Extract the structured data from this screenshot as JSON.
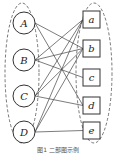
{
  "diagram": {
    "type": "bipartite-graph",
    "colors": {
      "stroke": "#333333",
      "edge": "#444444",
      "dashed": "#555555",
      "fill": "#ffffff"
    },
    "left_set": {
      "shape": "circle",
      "ellipse": {
        "cx": 22,
        "cy": 73,
        "rx": 17,
        "ry": 70
      },
      "nodes": [
        {
          "id": "A",
          "label": "A",
          "x": 24,
          "y": 23
        },
        {
          "id": "B",
          "label": "B",
          "x": 24,
          "y": 60
        },
        {
          "id": "C",
          "label": "C",
          "x": 24,
          "y": 96
        },
        {
          "id": "D",
          "label": "D",
          "x": 24,
          "y": 132
        }
      ],
      "radius": 11
    },
    "right_set": {
      "shape": "square",
      "ellipse": {
        "cx": 94,
        "cy": 73,
        "rx": 18,
        "ry": 70
      },
      "nodes": [
        {
          "id": "a",
          "label": "a",
          "x": 83,
          "y": 11
        },
        {
          "id": "b",
          "label": "b",
          "x": 83,
          "y": 40
        },
        {
          "id": "c",
          "label": "c",
          "x": 83,
          "y": 69
        },
        {
          "id": "d",
          "label": "d",
          "x": 83,
          "y": 97
        },
        {
          "id": "e",
          "label": "e",
          "x": 83,
          "y": 122
        }
      ],
      "size": 17
    },
    "edges": [
      [
        "A",
        "b"
      ],
      [
        "A",
        "d"
      ],
      [
        "B",
        "a"
      ],
      [
        "B",
        "b"
      ],
      [
        "B",
        "c"
      ],
      [
        "C",
        "a"
      ],
      [
        "C",
        "b"
      ],
      [
        "C",
        "d"
      ],
      [
        "D",
        "a"
      ],
      [
        "D",
        "b"
      ],
      [
        "D",
        "e"
      ]
    ]
  },
  "caption": "图1 二部图示例"
}
